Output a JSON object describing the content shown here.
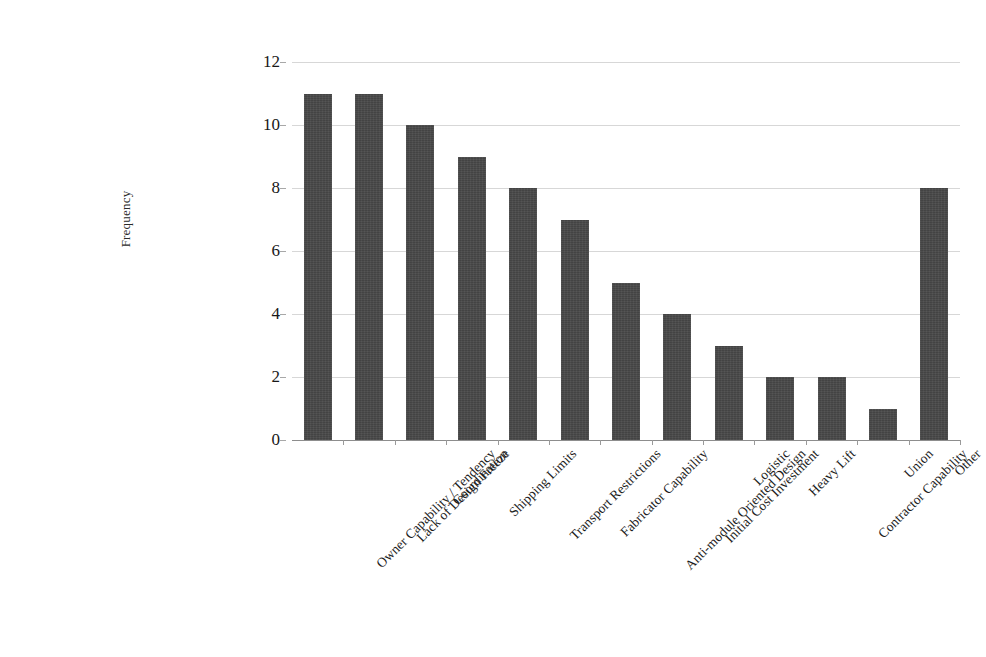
{
  "chart_data": {
    "type": "bar",
    "title": "",
    "xlabel": "",
    "ylabel": "Frequency",
    "ylim": [
      0,
      12
    ],
    "ytick_labels": [
      "0",
      "2",
      "4",
      "6",
      "8",
      "10",
      "12"
    ],
    "ytick_values": [
      0,
      2,
      4,
      6,
      8,
      10,
      12
    ],
    "grid": true,
    "legend": "none",
    "bar_color": "#474747",
    "gridline_color": "#c9c9c9",
    "categories": [
      "Owner Capability / Tendency",
      "Lack of Design Freeze",
      "Coordination",
      "Shipping Limits",
      "Transport Restrictions",
      "Fabricator Capability",
      "Anti-module Oriented Design",
      "Initial Cost Investment",
      "Logistic",
      "Heavy Lift",
      "Contractor Capability",
      "Union",
      "Other"
    ],
    "values": [
      11,
      11,
      10,
      9,
      8,
      7,
      5,
      4,
      3,
      2,
      2,
      1,
      8
    ]
  }
}
